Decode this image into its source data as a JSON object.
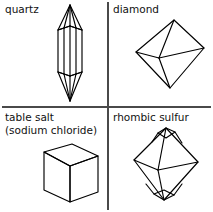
{
  "figure": {
    "background_color": "#ffffff",
    "line_color": "#000000",
    "divider_color": "#4a4a4a"
  },
  "quadrants": [
    {
      "key": "quartz",
      "label": "quartz",
      "label_line2": "",
      "shape": "hexagonal prism with pyramidal terminations",
      "position": "top-left"
    },
    {
      "key": "diamond",
      "label": "diamond",
      "label_line2": "",
      "shape": "octahedron",
      "position": "top-right"
    },
    {
      "key": "table_salt",
      "label": "table salt",
      "label_line2": "(sodium chloride)",
      "shape": "cube",
      "position": "bottom-left"
    },
    {
      "key": "rhombic_sulfur",
      "label": "rhombic sulfur",
      "label_line2": "",
      "shape": "truncated rhombic bipyramid",
      "position": "bottom-right"
    }
  ]
}
